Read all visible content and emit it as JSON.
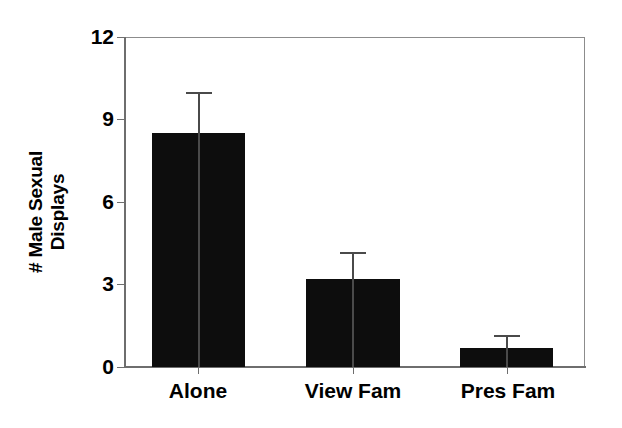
{
  "chart_data": {
    "type": "bar",
    "title": "",
    "subtitle": "",
    "xlabel": "",
    "ylabel": "# Male Sexual Displays",
    "ylabel_lines": [
      "# Male Sexual",
      "Displays"
    ],
    "categories": [
      "Alone",
      "View Fam",
      "Pres Fam"
    ],
    "values": [
      8.5,
      3.2,
      0.7
    ],
    "errors_upper": [
      1.5,
      1.0,
      0.45
    ],
    "error_tops": [
      10.0,
      4.2,
      1.15
    ],
    "ylim": [
      0,
      12
    ],
    "yticks": [
      0,
      3,
      6,
      9,
      12
    ],
    "ytick_labels": [
      "0",
      "3",
      "6",
      "9",
      "12"
    ],
    "grid": false,
    "legend": false,
    "legend_position": "none",
    "bar_color": "#0d0d0d",
    "error_color": "#4a4a4a",
    "axis_color": "#6e6e6e",
    "background_color": "#ffffff",
    "error_style": "upper-only-whisker"
  }
}
